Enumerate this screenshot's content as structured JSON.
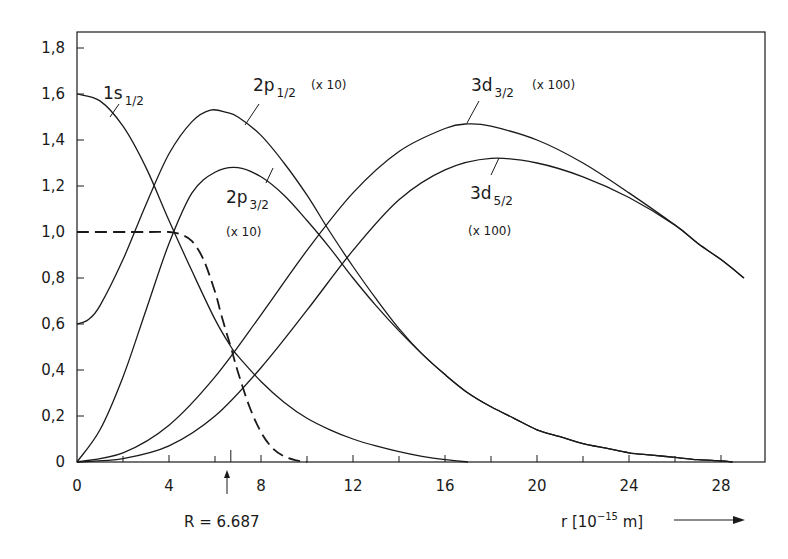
{
  "chart_data": {
    "type": "line",
    "title": "",
    "xlabel": "r [10^-15 m]",
    "ylabel": "",
    "xlim": [
      0,
      29
    ],
    "ylim": [
      0,
      1.87
    ],
    "grid": false,
    "x_ticks": [
      0,
      4,
      8,
      12,
      16,
      20,
      24,
      28
    ],
    "x_minor_ticks": [
      2,
      6,
      10,
      14,
      18,
      22,
      26
    ],
    "y_ticks": [
      0,
      0.2,
      0.4,
      0.6,
      0.8,
      1.0,
      1.2,
      1.4,
      1.6,
      1.8
    ],
    "y_tick_labels": [
      "0",
      "0,2",
      "0,4",
      "0,6",
      "0,8",
      "1,0",
      "1,2",
      "1,4",
      "1,6",
      "1,8"
    ],
    "annotation": {
      "text": "R = 6.687",
      "x": 6.687
    },
    "series": [
      {
        "name": "1s1/2",
        "label_main": "1s",
        "label_sub": "1/2",
        "factor": "",
        "style": "solid",
        "points": [
          [
            0,
            1.6
          ],
          [
            1,
            1.57
          ],
          [
            2,
            1.46
          ],
          [
            3,
            1.28
          ],
          [
            4,
            1.05
          ],
          [
            5,
            0.83
          ],
          [
            6,
            0.62
          ],
          [
            6.7,
            0.5
          ],
          [
            7,
            0.46
          ],
          [
            8,
            0.35
          ],
          [
            9,
            0.26
          ],
          [
            10,
            0.19
          ],
          [
            11,
            0.14
          ],
          [
            12,
            0.1
          ],
          [
            13,
            0.07
          ],
          [
            14,
            0.045
          ],
          [
            15,
            0.025
          ],
          [
            16,
            0.01
          ],
          [
            17,
            0.0
          ]
        ]
      },
      {
        "name": "2p1/2",
        "label_main": "2p",
        "label_sub": "1/2",
        "factor": "(x 10)",
        "style": "solid",
        "points": [
          [
            0,
            0.6
          ],
          [
            0.5,
            0.62
          ],
          [
            1,
            0.68
          ],
          [
            2,
            0.88
          ],
          [
            3,
            1.12
          ],
          [
            4,
            1.34
          ],
          [
            5,
            1.48
          ],
          [
            5.8,
            1.53
          ],
          [
            6.5,
            1.52
          ],
          [
            7,
            1.5
          ],
          [
            8,
            1.42
          ],
          [
            9,
            1.3
          ],
          [
            10,
            1.16
          ],
          [
            11,
            1.0
          ],
          [
            12,
            0.85
          ],
          [
            13,
            0.71
          ],
          [
            14,
            0.58
          ],
          [
            15,
            0.47
          ],
          [
            16,
            0.38
          ],
          [
            17,
            0.3
          ],
          [
            18,
            0.24
          ],
          [
            19,
            0.19
          ],
          [
            20,
            0.14
          ],
          [
            21,
            0.11
          ],
          [
            22,
            0.08
          ],
          [
            23,
            0.06
          ],
          [
            24,
            0.04
          ],
          [
            25,
            0.03
          ],
          [
            26,
            0.02
          ],
          [
            27,
            0.01
          ],
          [
            28,
            0.005
          ],
          [
            28.5,
            0.0
          ]
        ]
      },
      {
        "name": "2p3/2",
        "label_main": "2p",
        "label_sub": "3/2",
        "factor": "(x 10)",
        "style": "solid",
        "points": [
          [
            0,
            0.0
          ],
          [
            1,
            0.14
          ],
          [
            2,
            0.37
          ],
          [
            3,
            0.66
          ],
          [
            4,
            0.95
          ],
          [
            5,
            1.17
          ],
          [
            6,
            1.26
          ],
          [
            7,
            1.28
          ],
          [
            8,
            1.24
          ],
          [
            9,
            1.16
          ],
          [
            10,
            1.05
          ],
          [
            11,
            0.93
          ],
          [
            12,
            0.8
          ],
          [
            13,
            0.68
          ],
          [
            14,
            0.57
          ],
          [
            15,
            0.47
          ],
          [
            16,
            0.38
          ],
          [
            17,
            0.3
          ],
          [
            18,
            0.24
          ],
          [
            19,
            0.19
          ],
          [
            20,
            0.14
          ],
          [
            21,
            0.11
          ],
          [
            22,
            0.08
          ],
          [
            23,
            0.06
          ],
          [
            24,
            0.04
          ],
          [
            25,
            0.03
          ],
          [
            26,
            0.02
          ],
          [
            27,
            0.01
          ],
          [
            28,
            0.005
          ],
          [
            28.5,
            0.0
          ]
        ]
      },
      {
        "name": "3d3/2",
        "label_main": "3d",
        "label_sub": "3/2",
        "factor": "(x 100)",
        "style": "solid",
        "points": [
          [
            0,
            0.0
          ],
          [
            2,
            0.04
          ],
          [
            4,
            0.16
          ],
          [
            6,
            0.37
          ],
          [
            8,
            0.64
          ],
          [
            10,
            0.92
          ],
          [
            12,
            1.17
          ],
          [
            14,
            1.35
          ],
          [
            16,
            1.45
          ],
          [
            17,
            1.47
          ],
          [
            18,
            1.46
          ],
          [
            20,
            1.4
          ],
          [
            22,
            1.3
          ],
          [
            24,
            1.17
          ],
          [
            26,
            1.03
          ],
          [
            27,
            0.95
          ],
          [
            28,
            0.88
          ],
          [
            29,
            0.8
          ]
        ]
      },
      {
        "name": "3d5/2",
        "label_main": "3d",
        "label_sub": "5/2",
        "factor": "(x 100)",
        "style": "solid",
        "points": [
          [
            0,
            0.0
          ],
          [
            2,
            0.015
          ],
          [
            4,
            0.07
          ],
          [
            6,
            0.2
          ],
          [
            8,
            0.41
          ],
          [
            10,
            0.66
          ],
          [
            12,
            0.92
          ],
          [
            14,
            1.14
          ],
          [
            16,
            1.27
          ],
          [
            18,
            1.32
          ],
          [
            20,
            1.3
          ],
          [
            22,
            1.24
          ],
          [
            24,
            1.15
          ],
          [
            26,
            1.03
          ],
          [
            27,
            0.95
          ],
          [
            28,
            0.88
          ],
          [
            29,
            0.8
          ]
        ]
      },
      {
        "name": "charge-distribution",
        "label_main": "",
        "label_sub": "",
        "factor": "",
        "style": "dashed",
        "points": [
          [
            0,
            1.0
          ],
          [
            3,
            1.0
          ],
          [
            4,
            1.0
          ],
          [
            4.5,
            0.99
          ],
          [
            5,
            0.96
          ],
          [
            5.5,
            0.88
          ],
          [
            6,
            0.74
          ],
          [
            6.3,
            0.63
          ],
          [
            6.687,
            0.5
          ],
          [
            7,
            0.39
          ],
          [
            7.5,
            0.24
          ],
          [
            8,
            0.13
          ],
          [
            8.5,
            0.06
          ],
          [
            9,
            0.025
          ],
          [
            9.5,
            0.008
          ],
          [
            10,
            0.0
          ]
        ]
      }
    ]
  },
  "labels": {
    "s1": {
      "main": "1s",
      "sub": "1/2"
    },
    "p12": {
      "main": "2p",
      "sub": "1/2",
      "factor": "(x 10)"
    },
    "p32": {
      "main": "2p",
      "sub": "3/2",
      "factor": "(x 10)"
    },
    "d32": {
      "main": "3d",
      "sub": "3/2",
      "factor": "(x 100)"
    },
    "d52": {
      "main": "3d",
      "sub": "5/2",
      "factor": "(x 100)"
    },
    "radius": "R = 6.687",
    "xaxis_base": "r [10",
    "xaxis_exp": "−15",
    "xaxis_unit": " m]"
  }
}
